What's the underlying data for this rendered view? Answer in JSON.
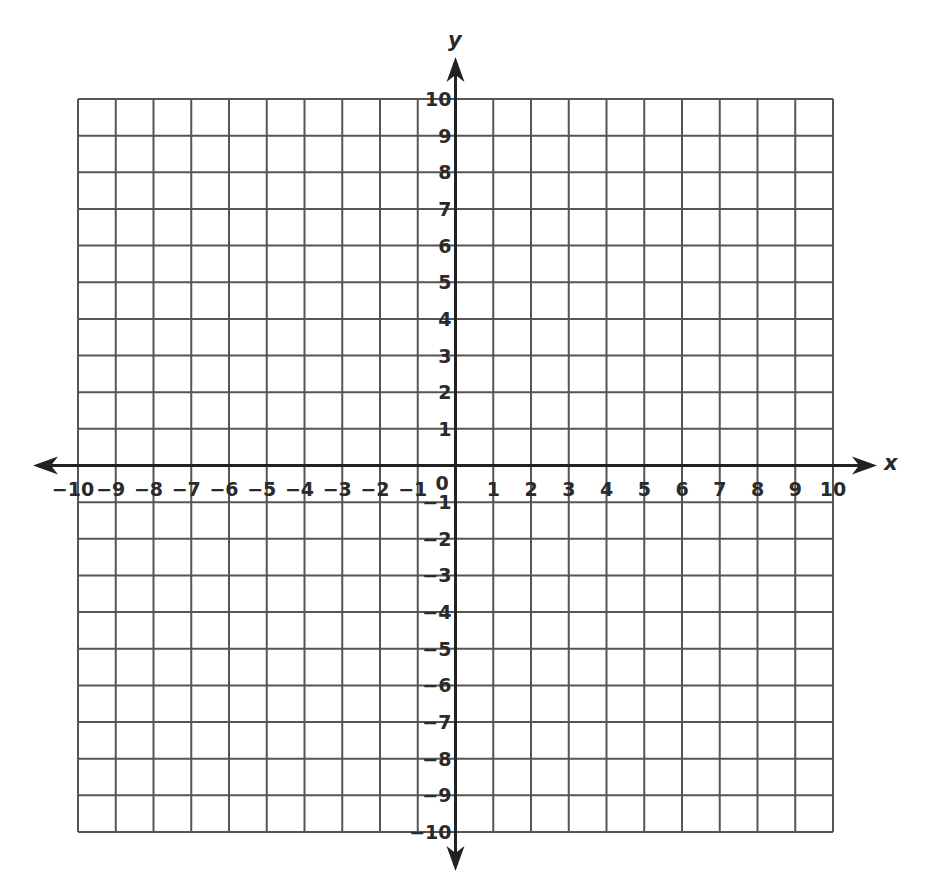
{
  "chart_data": {
    "type": "scatter",
    "title": "",
    "xlabel": "x",
    "ylabel": "y",
    "xlim": [
      -10,
      10
    ],
    "ylim": [
      -10,
      10
    ],
    "grid": true,
    "legend": null,
    "series": [],
    "x_ticks": [
      -10,
      -9,
      -8,
      -7,
      -6,
      -5,
      -4,
      -3,
      -2,
      -1,
      1,
      2,
      3,
      4,
      5,
      6,
      7,
      8,
      9,
      10
    ],
    "y_ticks": [
      10,
      9,
      8,
      7,
      6,
      5,
      4,
      3,
      2,
      1,
      -1,
      -2,
      -3,
      -4,
      -5,
      -6,
      -7,
      -8,
      -9,
      -10
    ],
    "origin_label": "0",
    "x_tick_labels": [
      "−10",
      "−9",
      "−8",
      "−7",
      "−6",
      "−5",
      "−4",
      "−3",
      "−2",
      "−1",
      "1",
      "2",
      "3",
      "4",
      "5",
      "6",
      "7",
      "8",
      "9",
      "10"
    ],
    "y_tick_labels": [
      "10",
      "9",
      "8",
      "7",
      "6",
      "5",
      "4",
      "3",
      "2",
      "1",
      "−1",
      "−2",
      "−3",
      "−4",
      "−5",
      "−6",
      "−7",
      "−8",
      "−9",
      "−10"
    ]
  },
  "axes": {
    "x_name": "x",
    "y_name": "y",
    "origin": "0"
  },
  "style": {
    "grid_color": "#555555",
    "axis_color": "#222222",
    "label_color": "#2a2a2a",
    "background": "#ffffff"
  }
}
